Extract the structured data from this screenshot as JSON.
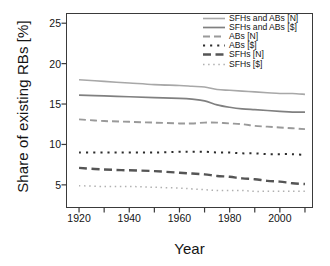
{
  "chart_data": {
    "type": "line",
    "title": "",
    "xlabel": "Year",
    "ylabel": "Share of existing RBs [%]",
    "xlim": [
      1915,
      2013
    ],
    "ylim": [
      2.2,
      26.2
    ],
    "grid": false,
    "legend_position": "top-right",
    "xticks": [
      1920,
      1940,
      1960,
      1980,
      2000
    ],
    "xticks_minor": [
      1930,
      1950,
      1970,
      1990,
      2010
    ],
    "yticks": [
      5,
      10,
      15,
      20,
      25
    ],
    "x": [
      1920,
      1930,
      1940,
      1950,
      1960,
      1965,
      1970,
      1975,
      1980,
      1985,
      1990,
      1995,
      2000,
      2005,
      2010
    ],
    "series": [
      {
        "name": "SFHs and ABs [N]",
        "style": "solid",
        "color": "#a8a8a8",
        "width": 1.6,
        "values": [
          18.0,
          17.8,
          17.6,
          17.4,
          17.3,
          17.2,
          17.1,
          16.8,
          16.7,
          16.6,
          16.5,
          16.4,
          16.3,
          16.3,
          16.2
        ]
      },
      {
        "name": "SFHs and ABs [$]",
        "style": "solid",
        "color": "#808080",
        "width": 1.7,
        "values": [
          16.1,
          16.0,
          15.9,
          15.8,
          15.7,
          15.6,
          15.4,
          14.9,
          14.6,
          14.4,
          14.3,
          14.2,
          14.1,
          14.0,
          14.0
        ]
      },
      {
        "name": "ABs [N]",
        "style": "dashed",
        "color": "#9a9a9a",
        "width": 1.9,
        "values": [
          13.1,
          12.9,
          12.8,
          12.7,
          12.6,
          12.6,
          12.7,
          12.7,
          12.6,
          12.5,
          12.3,
          12.2,
          12.1,
          12.0,
          11.9
        ]
      },
      {
        "name": "ABs [$]",
        "style": "dotted-thick",
        "color": "#2c2c2c",
        "width": 2.0,
        "values": [
          9.0,
          9.0,
          9.0,
          9.0,
          9.1,
          9.1,
          9.1,
          9.0,
          9.0,
          8.9,
          8.9,
          8.8,
          8.8,
          8.8,
          8.7
        ]
      },
      {
        "name": "SFHs [N]",
        "style": "dashed-thick",
        "color": "#555555",
        "width": 2.4,
        "values": [
          7.1,
          6.9,
          6.8,
          6.7,
          6.5,
          6.4,
          6.3,
          6.1,
          6.0,
          5.8,
          5.7,
          5.5,
          5.4,
          5.2,
          5.1
        ]
      },
      {
        "name": "SFHs [$]",
        "style": "dotted-thin",
        "color": "#b0b0b0",
        "width": 1.5,
        "values": [
          4.9,
          4.8,
          4.8,
          4.7,
          4.6,
          4.5,
          4.4,
          4.3,
          4.3,
          4.3,
          4.2,
          4.2,
          4.2,
          4.2,
          4.2
        ]
      }
    ]
  },
  "legend": {
    "items": [
      {
        "label": "SFHs and ABs [N]"
      },
      {
        "label": "SFHs and ABs [$]"
      },
      {
        "label": "ABs [N]"
      },
      {
        "label": "ABs [$]"
      },
      {
        "label": "SFHs [N]"
      },
      {
        "label": "SFHs [$]"
      }
    ]
  }
}
